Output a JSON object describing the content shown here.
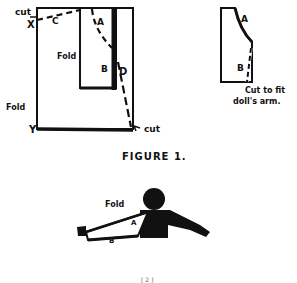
{
  "figure1": {
    "title": "FIGURE 1.",
    "left_pattern": {
      "label_cut_top": "cut",
      "label_x": "X",
      "label_c": "C",
      "label_a": "A",
      "label_b": "B",
      "label_d": "D",
      "label_fold_inner": "Fold",
      "label_fold_outer": "Fold",
      "label_y": "Y",
      "label_cut_bottom": "cut"
    },
    "right_pattern": {
      "label_a": "A",
      "label_b": "B",
      "caption_line1": "Cut to fit",
      "caption_line2": "doll's arm."
    }
  },
  "arm_diagram": {
    "label_fold": "Fold",
    "label_a": "A",
    "label_b": "B"
  },
  "page_number": "[ 2 ]"
}
